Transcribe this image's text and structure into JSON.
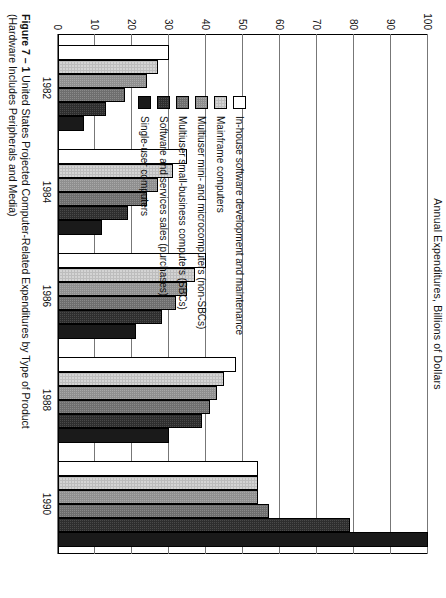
{
  "figure": {
    "label": "Figure 7 – 1",
    "caption": "United States  Projected  Computer-Related  Expenditures  by  Type  of  Product  (Hardware  Includes Peripherals and Media)"
  },
  "axis_title": "Annual Expenditures, Billions of Dollars",
  "legend": {
    "items": [
      {
        "label": "In-house software development and maintenance",
        "swatch": "white-open-square-icon",
        "color": "#ffffff"
      },
      {
        "label": "Mainframe computers",
        "swatch": "light-gray-square-icon",
        "color": "#d4d4d4"
      },
      {
        "label": "Multiuser mini- and microcomputers (non-SBCs)",
        "swatch": "medium-gray-square-icon",
        "color": "#a8a8a8"
      },
      {
        "label": "Multiuser small-business computers (SBCs)",
        "swatch": "dark-gray-square-icon",
        "color": "#8a8a8a"
      },
      {
        "label": "Software and services sales (purchases)",
        "swatch": "very-dark-gray-square-icon",
        "color": "#4a4a4a"
      },
      {
        "label": "Single-user computers",
        "swatch": "black-square-icon",
        "color": "#1a1a1a"
      }
    ]
  },
  "chart_data": {
    "type": "bar",
    "orientation": "horizontal",
    "title": "United States Projected Computer-Related Expenditures by Type of Product",
    "xlabel": "",
    "ylabel": "Annual Expenditures, Billions of Dollars",
    "ylim": [
      0,
      100
    ],
    "yticks": [
      0,
      10,
      20,
      30,
      40,
      50,
      60,
      70,
      80,
      90,
      100
    ],
    "ytick_labels": [
      "0",
      "10",
      "20",
      "30",
      "40",
      "50",
      "60",
      "70",
      "80",
      "90",
      "100"
    ],
    "grid": true,
    "legend_position": "left",
    "categories": [
      "1982",
      "1984",
      "1986",
      "1988",
      "1990"
    ],
    "series": [
      {
        "name": "In-house software development and maintenance",
        "color": "#ffffff",
        "values": [
          30,
          35,
          40,
          48,
          54
        ]
      },
      {
        "name": "Mainframe computers",
        "color": "#d4d4d4",
        "values": [
          27,
          31,
          37,
          45,
          54
        ]
      },
      {
        "name": "Multiuser mini- and microcomputers (non-SBCs)",
        "color": "#a8a8a8",
        "values": [
          24,
          27,
          35,
          43,
          54
        ]
      },
      {
        "name": "Multiuser small-business computers (SBCs)",
        "color": "#8a8a8a",
        "values": [
          18,
          24,
          32,
          41,
          57
        ]
      },
      {
        "name": "Software and services sales (purchases)",
        "color": "#4a4a4a",
        "values": [
          13,
          19,
          28,
          39,
          79
        ]
      },
      {
        "name": "Single-user computers",
        "color": "#1a1a1a",
        "values": [
          7,
          12,
          21,
          30,
          100
        ]
      }
    ]
  }
}
